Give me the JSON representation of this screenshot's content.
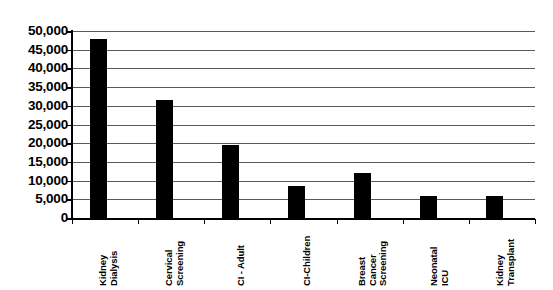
{
  "chart_data": {
    "type": "bar",
    "title": "",
    "subtitle": "",
    "xlabel": "",
    "ylabel": "",
    "categories": [
      "Kidney Dialysis",
      "Cervical Screening",
      "CI - Adult",
      "CI-Children",
      "Breast Cancer Screening",
      "Neonatal ICU",
      "Kidney Transplant"
    ],
    "category_lines": [
      [
        "Kidney",
        "Dialysis"
      ],
      [
        "Cervical",
        "Screening"
      ],
      [
        "CI - Adult"
      ],
      [
        "CI-Children"
      ],
      [
        "Breast",
        "Cancer",
        "Screening"
      ],
      [
        "Neonatal",
        "ICU"
      ],
      [
        "Kidney",
        "Transplant"
      ]
    ],
    "values": [
      48000,
      31500,
      19500,
      8500,
      12000,
      5900,
      5900
    ],
    "ylim": [
      0,
      50000
    ],
    "ytick_values": [
      0,
      5000,
      10000,
      15000,
      20000,
      25000,
      30000,
      35000,
      40000,
      45000,
      50000
    ],
    "ytick_labels": [
      "0",
      "5,000",
      "10,000",
      "15,000",
      "20,000",
      "25,000",
      "30,000",
      "35,000",
      "40,000",
      "45,000",
      "50,000"
    ],
    "grid": true,
    "grid_orientation": "horizontal",
    "legend": false,
    "legend_position": "none",
    "bar_color": "#000000",
    "gridline_color": "#5a5a5a",
    "axis_color": "#000000",
    "background_color": "#ffffff",
    "label_rotation_degrees": 90
  }
}
